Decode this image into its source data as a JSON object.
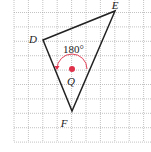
{
  "diagram": {
    "type": "geometry-rotation",
    "grid": {
      "spacing": 14.4,
      "x_start": 14,
      "y_start": 0,
      "x_end": 151,
      "y_end": 142
    },
    "triangle": {
      "vertices": [
        {
          "name": "D",
          "x": 43,
          "y": 40,
          "label_x": 33,
          "label_y": 40
        },
        {
          "name": "E",
          "x": 115,
          "y": 11,
          "label_x": 115,
          "label_y": 6
        },
        {
          "name": "F",
          "x": 72,
          "y": 111,
          "label_x": 64,
          "label_y": 124
        }
      ],
      "stroke_color": "#222222"
    },
    "center": {
      "name": "Q",
      "x": 72,
      "y": 69,
      "label_x": 67,
      "label_y": 82,
      "color": "#e0314b"
    },
    "rotation": {
      "angle_label": "180°",
      "label_x": 63,
      "label_y": 53,
      "arc_radius": 15,
      "arc_color": "#e0314b"
    }
  }
}
